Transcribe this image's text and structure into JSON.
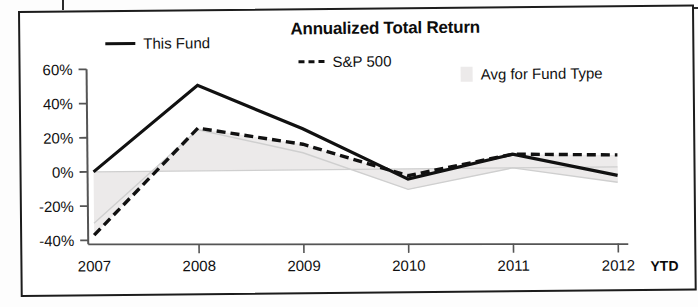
{
  "chart_data": {
    "type": "line",
    "title": "Annualized Total Return",
    "xlabel": "",
    "ylabel": "",
    "categories": [
      "2007",
      "2008",
      "2009",
      "2010",
      "2011",
      "2012"
    ],
    "x_tick_labels": [
      "2007",
      "2008",
      "2009",
      "2010",
      "2011",
      "2012"
    ],
    "x_axis_suffix": "YTD",
    "y_tick_labels": [
      "60%",
      "40%",
      "20%",
      "0%",
      "-20%",
      "-40%"
    ],
    "y_ticks": [
      60,
      40,
      20,
      0,
      -20,
      -40
    ],
    "ylim": [
      -40,
      60
    ],
    "grid": false,
    "legend_position": "top",
    "series": [
      {
        "name": "This Fund",
        "style": "solid",
        "color": "#111111",
        "values": [
          0,
          50,
          24,
          -6,
          8,
          -5
        ]
      },
      {
        "name": "S&P 500",
        "style": "dashed",
        "color": "#111111",
        "values": [
          -37,
          25,
          15,
          -4,
          8,
          7
        ]
      },
      {
        "name": "Avg for Fund Type",
        "style": "area",
        "color": "#eceaea",
        "values": [
          -30,
          24,
          10,
          -12,
          0,
          -9
        ]
      }
    ],
    "legend": [
      {
        "label": "This Fund",
        "marker": "solid-line"
      },
      {
        "label": "S&P 500",
        "marker": "dashed-line"
      },
      {
        "label": "Avg for Fund Type",
        "marker": "area-swatch"
      }
    ],
    "colors": {
      "line": "#111111",
      "area_fill": "#eceaea",
      "area_stroke": "#cfcfcf",
      "axis": "#555555",
      "frame": "#1c1c1c",
      "background": "#ffffff"
    }
  }
}
